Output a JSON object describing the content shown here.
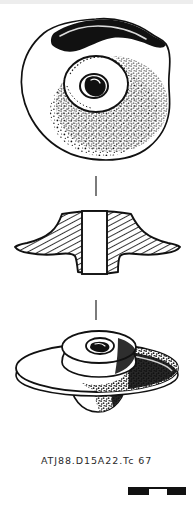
{
  "plate": {
    "kind": "archaeological-object-drawing",
    "background_color": "#ffffff",
    "ink_color": "#111111",
    "width_px": 193,
    "height_px": 509
  },
  "caption": {
    "text": "ATJ88.D15A22.Tc 67",
    "site_code": "ATJ88",
    "context": "D15A22",
    "material_code": "Tc",
    "object_number": "67"
  },
  "views": [
    {
      "id": "plan-view",
      "label": "plan view",
      "description": "Roughly circular perforated disc seen from above, with a raised central boss and a small off-centre perforation; dark solid shading along the upper-left edge and stipple shading across the lower-right quadrant.",
      "bounds": {
        "x": 18,
        "y": 18,
        "width": 152,
        "height": 140
      }
    },
    {
      "id": "cross-section-view",
      "label": "cross section",
      "description": "Bi-conical profile section with diagonal hatching and a white rectangular central perforation channel.",
      "bounds": {
        "x": 14,
        "y": 208,
        "width": 166,
        "height": 72
      }
    },
    {
      "id": "perspective-view",
      "label": "perspective view",
      "description": "Three-quarter perspective showing the flange disc, raised upper boss with perforation and shaded underside.",
      "bounds": {
        "x": 14,
        "y": 325,
        "width": 166,
        "height": 100
      }
    }
  ],
  "separators": [
    {
      "id": "separator-1",
      "x": 96,
      "y_start": 176,
      "y_end": 196
    },
    {
      "id": "separator-2",
      "x": 96,
      "y_start": 300,
      "y_end": 320
    }
  ],
  "scalebar": {
    "label": "",
    "x": 128,
    "y": 487,
    "width_px": 58,
    "height_px": 8,
    "segments": 3,
    "fill_color": "#111111",
    "gap_color": "#ffffff"
  }
}
